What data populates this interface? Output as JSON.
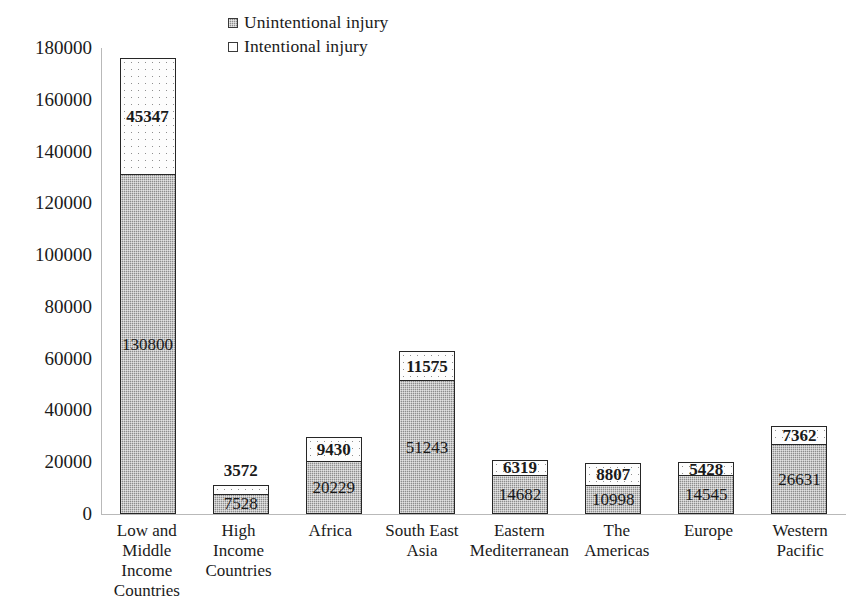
{
  "chart_data": {
    "type": "bar",
    "subtype": "stacked-vertical",
    "title": "",
    "xlabel": "",
    "ylabel": "",
    "ylim": [
      0,
      180000
    ],
    "ytick_step": 20000,
    "yticks": [
      "180000",
      "160000",
      "140000",
      "120000",
      "100000",
      "80000",
      "60000",
      "40000",
      "20000",
      "0"
    ],
    "ytick_values": [
      180000,
      160000,
      140000,
      120000,
      100000,
      80000,
      60000,
      40000,
      20000,
      0
    ],
    "grid": false,
    "legend_position": "top-left",
    "categories": [
      "Low and Middle Income Countries",
      "High Income Countries",
      "Africa",
      "South East Asia",
      "Eastern Mediterranean",
      "The Americas",
      "Europe",
      "Western Pacific"
    ],
    "category_lines": [
      [
        "Low and",
        "Middle",
        "Income",
        "Countries"
      ],
      [
        "High Income",
        "Countries"
      ],
      [
        "Africa"
      ],
      [
        "South East",
        "Asia"
      ],
      [
        "Eastern",
        "Mediterranean"
      ],
      [
        "The",
        "Americas"
      ],
      [
        "Europe"
      ],
      [
        "Western",
        "Pacific"
      ]
    ],
    "series": [
      {
        "name": "Unintentional injury",
        "color": "#8d8d8d",
        "values": [
          130800,
          7528,
          20229,
          51243,
          14682,
          10998,
          14545,
          26631
        ],
        "labels": [
          "130800",
          "7528",
          "20229",
          "51243",
          "14682",
          "10998",
          "14545",
          "26631"
        ],
        "label_bold": false
      },
      {
        "name": "Intentional injury",
        "color": "#ffffff",
        "values": [
          45347,
          3572,
          9430,
          11575,
          6319,
          8807,
          5428,
          7362
        ],
        "labels": [
          "45347",
          "3572",
          "9430",
          "11575",
          "6319",
          "8807",
          "5428",
          "7362"
        ],
        "label_bold": true,
        "label_outside_index": [
          1
        ]
      }
    ],
    "totals": [
      176147,
      11100,
      29659,
      62818,
      21001,
      19805,
      19973,
      33993
    ]
  },
  "legend": {
    "items": [
      {
        "label": "Unintentional injury",
        "marker": "filled-square-swatch"
      },
      {
        "label": "Intentional injury",
        "marker": "empty-square-swatch"
      }
    ]
  }
}
